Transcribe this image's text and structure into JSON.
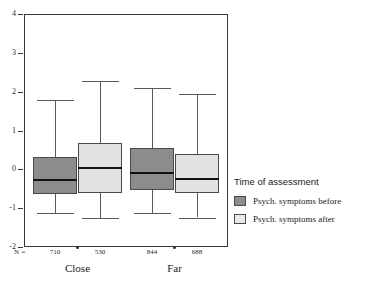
{
  "chart_data": {
    "type": "box",
    "title": "",
    "xlabel": "",
    "ylabel": "",
    "ylim": [
      -2,
      4
    ],
    "yticks": [
      4,
      3,
      2,
      1,
      0,
      -1,
      -2
    ],
    "ytick_labels": [
      "4",
      "3",
      "2",
      "1",
      "0",
      "-1",
      "-2"
    ],
    "grid": false,
    "categories": [
      "Close",
      "Far"
    ],
    "n_prefix": "N =",
    "n_values": [
      "710",
      "530",
      "844",
      "688"
    ],
    "legend": {
      "title": "Time of assessment",
      "position": "right",
      "entries": [
        {
          "label": "Psych. symptoms before",
          "color": "#8c8c8c"
        },
        {
          "label": "Psych. symptoms after",
          "color": "#e8e8e8"
        }
      ]
    },
    "series": [
      {
        "name": "Psych. symptoms before",
        "color": "#8c8c8c",
        "boxes": [
          {
            "category": "Close",
            "n": 710,
            "whisker_low": -1.13,
            "q1": -0.63,
            "median": -0.28,
            "q3": 0.32,
            "whisker_high": 1.78
          },
          {
            "category": "Far",
            "n": 844,
            "whisker_low": -1.13,
            "q1": -0.52,
            "median": -0.1,
            "q3": 0.56,
            "whisker_high": 2.09
          }
        ]
      },
      {
        "name": "Psych. symptoms after",
        "color": "#e2e2e2",
        "boxes": [
          {
            "category": "Close",
            "n": 530,
            "whisker_low": -1.25,
            "q1": -0.62,
            "median": 0.03,
            "q3": 0.68,
            "whisker_high": 2.28
          },
          {
            "category": "Far",
            "n": 688,
            "whisker_low": -1.25,
            "q1": -0.62,
            "median": -0.24,
            "q3": 0.39,
            "whisker_high": 1.93
          }
        ]
      }
    ],
    "colors": {
      "before": "#8c8c8c",
      "after": "#e2e2e2",
      "axis": "#3a3a3a",
      "median_line": "#111111",
      "whisker": "#5a5a5a",
      "background": "#ffffff"
    }
  },
  "footer": {
    "clipped_text": ""
  }
}
